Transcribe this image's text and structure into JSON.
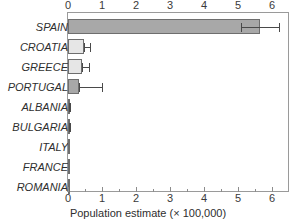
{
  "chart_data": {
    "type": "bar",
    "orientation": "horizontal",
    "title": "",
    "xlabel": "Population estimate (× 100,000)",
    "ylabel": "",
    "xlim": [
      0,
      6.4
    ],
    "grid": false,
    "legend": null,
    "axis_positions": [
      "top",
      "bottom"
    ],
    "xticks": [
      0,
      1,
      2,
      3,
      4,
      5,
      6
    ],
    "xticklabels": [
      "0",
      "1",
      "2",
      "3",
      "4",
      "5",
      "6"
    ],
    "xminorticks": [
      0.5,
      1.5,
      2.5,
      3.5,
      4.5,
      5.5
    ],
    "categories": [
      "SPAIN",
      "CROATIA",
      "GREECE",
      "PORTUGAL",
      "ALBANIA",
      "BULGARIA",
      "ITALY",
      "FRANCE",
      "ROMANIA"
    ],
    "values": [
      5.65,
      0.48,
      0.4,
      0.33,
      0.05,
      0.03,
      0.02,
      0.005,
      0.004
    ],
    "error_low": [
      5.1,
      0.48,
      0.4,
      0.33,
      0.03,
      0.03,
      0.02,
      0.005,
      0.004
    ],
    "error_high": [
      6.2,
      0.66,
      0.62,
      1.0,
      0.07,
      0.06,
      0.02,
      0.005,
      0.004
    ],
    "bar_colors": [
      "#a8a8a8",
      "#e6e6e6",
      "#e6e6e6",
      "#a8a8a8",
      "#f2f2f2",
      "#5a5a5a",
      "#4a4a4a",
      "#ffffff",
      "#ffffff"
    ],
    "bar_edge_color": "#6e6e6e",
    "error_color": "#4a4a4a",
    "frame_color": "#9a9a9a",
    "text_color": "#2e2e2e",
    "background": "#ffffff"
  }
}
